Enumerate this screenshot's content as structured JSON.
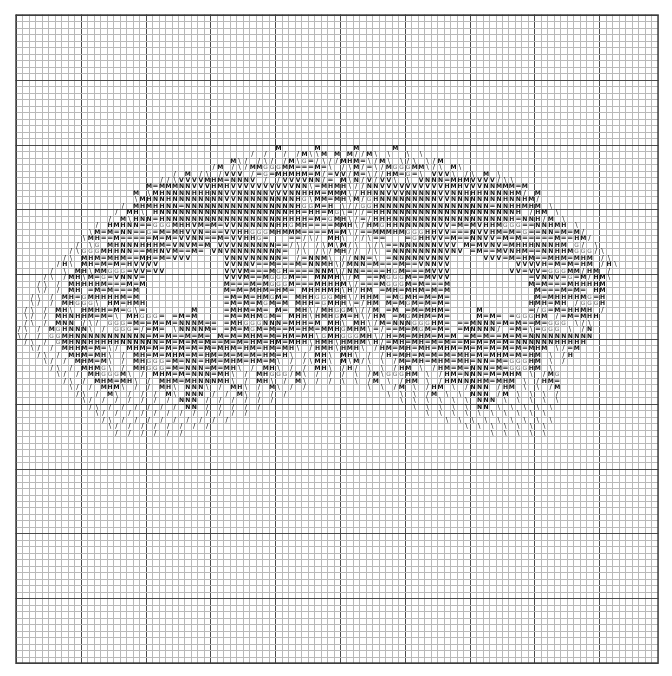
{
  "document": {
    "type": "cross-stitch-pattern-chart",
    "title": "Cross Stitch Pattern Chart",
    "description": "Monochrome counted cross-stitch symbol chart on graph paper showing a round wreath / tree-canopy motif with an unstitched open area near the centre."
  },
  "grid": {
    "columns": 99,
    "rows": 100,
    "cell_size_px": 6.48,
    "origin_x_px": 15,
    "origin_y_px": 14,
    "minor_line_color": "#b9b9b9",
    "major_line_color": "#4a4a4a",
    "border_color": "#3a3a3a",
    "major_line_every": 10,
    "background_color": "#ffffff"
  },
  "legend": {
    "title": "Symbols used",
    "symbols": [
      {
        "key": "H",
        "glyph": "H",
        "name": "bold-h-symbol",
        "color": "#111111"
      },
      {
        "key": "N",
        "glyph": "N",
        "name": "bold-n-symbol",
        "color": "#111111"
      },
      {
        "key": "V",
        "glyph": "V",
        "name": "bold-v-symbol",
        "color": "#111111"
      },
      {
        "key": "E",
        "glyph": "=",
        "name": "equals-symbol",
        "color": "#111111"
      },
      {
        "key": "G",
        "glyph": "G",
        "name": "outline-g-symbol",
        "color": "#666666"
      },
      {
        "key": "B",
        "glyph": "\\",
        "name": "backslash-symbol",
        "color": "#1a1a1a"
      },
      {
        "key": "F",
        "glyph": "/",
        "name": "slash-symbol",
        "color": "#1a1a1a"
      },
      {
        "key": "M",
        "glyph": "M",
        "name": "bold-m-symbol",
        "color": "#111111"
      },
      {
        "key": ".",
        "glyph": "",
        "name": "empty-cell",
        "color": "#ffffff"
      }
    ]
  },
  "chart_data": {
    "type": "heatmap",
    "xlabel": "",
    "ylabel": "",
    "grid": true,
    "legend_position": "none",
    "x": 99,
    "y": 100,
    "categories": [
      "H",
      "N",
      "V",
      "=",
      "G",
      "\\",
      "/",
      "M",
      "empty"
    ],
    "rows": [
      "...................................................................................................",
      "...................................................................................................",
      "...................................................................................................",
      "...................................................................................................",
      "...................................................................................................",
      "...................................................................................................",
      "...................................................................................................",
      "...................................................................................................",
      "...................................................................................................",
      "...................................................................................................",
      "...................................................................................................",
      "...................................................................................................",
      "...................................................................................................",
      "...................................................................................................",
      "...................................................................................................",
      "...................................................................................................",
      "...................................................................................................",
      "...................................................................................................",
      "...................................................................................................",
      "...................................................................................................",
      "........................................M.....M....................................................",
      "....................................F.F..F.FM..M.M..FF.............................................",
      ".................................MBF.FBF.FMBG=FBFFMHM.BF...........................................",
      "..............................FM.FBFMMGGGMM===M=B.FB.F.BF..........................................",
      "........................F.M.FB.FVVV.F=G=MHMHM=.F=VVFM.BFF..........................................",
      "......................FFBVVVVMHM=NNNV.F.FVVVVNN.=.MB.F.F..........................................",
      "....................M=MMMNNVVVHMHVVVVVVVVVVNN.=MHM.BFF............................................",
      "..................M.BMHNNNNHHHNNVVNNNNNVVVNNHHM=MM.BF.............................................",
      "..................BMHNNHNNNNNNNNVVNNNNNNNNNHG.MM=MHB.F...........................................",
      "................F.MHMHHNN=NNNNNNNNNNNNNNNNNHGGM=H.BFF............................................",
      "...............F.MHB.HNNNNNNNNNNNNNNNNNNNNHH=HH=MGB.FF..........................................",
      "..............F.MBHNN=HNNNNNNNNNNNNNNNNNNHHHH=M=GMHBF.F.........................................",
      "............F.HMHNN==GGGMHHVM=M=VVNNNNNNHHGMH====MMHBF..........................................",
      "...........BM=M=NN==G=M=MHVVN===VVHHGGGMHMMM====M=.BF...........................................",
      "..........BMH==M=====M=M=VVNN==M=VVHHG=III==FBF.MHB.F..........................................",
      ".........F.BG.MHNNNHHHM=VNVM=M.VVVNNNNNN==FBF.F.MB.F..........................................",
      "........FBGGGMHHNN==MHNVM==M=.VNVNNNNNNNN=.FB.FBFMH.F.........................................",
      ".......FB.MHM=MHM==MH=M=VVV.....VNNVNNNNN=.F=NNMB.FF.........................................",
      "......FHB.MH=M=M=HVVVV..........VVNNV==M===M=NNMHBF..........................................",
      ".....F.B.MHBMMGGG=VV=VV.........VVVM===MGH====NNMBF.........................................",
      "....FB.FMHBM=G=VNNV=............VVVM==MGGGM==.MNMHBF........................................",
      "...FB.F.MHHHHM===M=M............M===M=MGGGM===MHHHMBF.......................................",
      "...BF.F.MH.=M=M===M.............M=M=MHM=HM=.MHHHMHB.F......................................",
      "..FB.F.MH=GMHHHHM=M.............=M=M=HMGM=.MHHGGGMHBF......................................",
      "..BF.F.MHGGGB.HM=HMH............=M=M=MGM=M.MHH=GMHHB.F.....................................",
      ".FB.F.MHB.HMHH=M=GB=.......M....=MHM=M=.M=.MHB.MHGGMB.F....................................",
      ".BF.F.MHNHHM=M=B.MHGGG=.=M=M....=M=MHMGM=.MHHB.MHGM=HBF...................................",
      ".FB.F.MNN.FBF.GGG=M==M=M=NNNM==.=MHGGGNNN=MHH=M.MHB.MHBF..................................",
      "FB.F.MGHNNNB.F.GGG=F=M=.BNNNNM=.=M=MGM=M==M=HM=.MHGMHMB.F................................",
      "BF.F.GGMHNNNNNNNNNNN=M=M==M=M=.M=M=MHM=M=HM=MHB.MHGGGMHBF................................",
      ".FB.F.GMHNNHHHHHNNNNNN=M=M=M=M==M=M=HM=HM=MHHB.MHB.MHMB.F...............................",
      "..BF.F.MHHM=M=BF.MHM=M=M=M=M=M=MHM=HM=HM=MHB.F.MHB.MHB.F...............................",
      "...FB.F.MHM=MHB.F.MH=M=MHM=M=HM=M=M=M=HM=HB.F.MHB.MHB.F...............................",
      "....BF.F.MHM=MB.F.MHGGG=M=NN=HM=MHM=HM=MB.F.F.MHB.MB.F...............................",
      ".....FB.F.MHMGB.F.MHGGG=M=NNN=M=MHB.F.MHB.F.F.MHB.F.F...............................",
      "......BF.F.MHGGGMB.F.MHM=M=NNN=MHB.F.MHGGGFMB.F.F.F.................................",
      ".......FB.F.MHM=MHB.F.MHM=MHNNNMHB.F.MHB.F.MB.F.F...................................",
      "........BF.F.MHMB.F.F.MHB.NNNB.F.MHB.F.MB.F.F.......................................",
      ".........FB.F.MB.F.F.F.MB.NNN.F.F.MB.F.F.F..........................................",
      "..........BF.F.F.F.F.F.F.NNN.F.F.F.F.F.F............................................",
      "...........FB.F.F.F.F.F.F.NN.F.F.F.F.F.............................................",
      "............BF.F.F.F.F.F.F.F.F.F.F.F...............................................",
      ".............FB.F.F.F.F.F.F.F.F.F..................................................",
      "..............BF.F.F.F.F.F.F.F.....................................................",
      "...............F.F.F.F.F.F.........................................................",
      "...................................................................................................",
      "...................................................................................................",
      "...................................................................................................",
      "...................................................................................................",
      "...................................................................................................",
      "...................................................................................................",
      "...................................................................................................",
      "...................................................................................................",
      "...................................................................................................",
      "...................................................................................................",
      "...................................................................................................",
      "...................................................................................................",
      "...................................................................................................",
      "...................................................................................................",
      "...................................................................................................",
      "...................................................................................................",
      "...................................................................................................",
      "...................................................................................................",
      "...................................................................................................",
      "...................................................................................................",
      "...................................................................................................",
      "...................................................................................................",
      "...................................................................................................",
      "...................................................................................................",
      "...................................................................................................",
      "...................................................................................................",
      "...................................................................................................",
      "...................................................................................................",
      "...................................................................................................",
      "...................................................................................................",
      "...................................................................................................",
      "...................................................................................................",
      "...................................................................................................",
      "...................................................................................................",
      "...................................................................................................",
      "..................................................................................................."
    ]
  }
}
